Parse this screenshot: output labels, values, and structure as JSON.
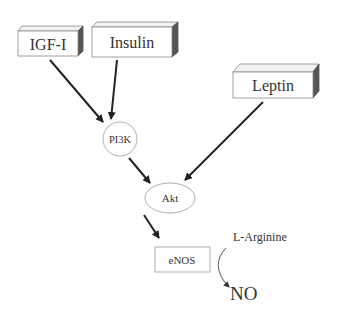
{
  "nodes": {
    "igf1": {
      "label": "IGF-I"
    },
    "insulin": {
      "label": "Insulin"
    },
    "leptin": {
      "label": "Leptin"
    },
    "pi3k": {
      "label": "PI3K"
    },
    "akt": {
      "label": "Akt"
    },
    "enos": {
      "label": "eNOS"
    },
    "larginine": {
      "label": "L-Arginine"
    },
    "no": {
      "label": "NO"
    }
  },
  "colors": {
    "stroke": "#333333",
    "box_side": "#555555",
    "box_top": "#f2f2f2",
    "outline": "#888888"
  }
}
